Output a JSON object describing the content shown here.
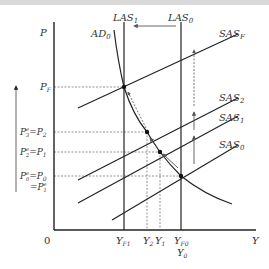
{
  "diagram": {
    "axes": {
      "y_label": "P",
      "x_label": "Y",
      "origin_label": "0"
    },
    "vertical_lines": [
      {
        "name": "LAS",
        "sub": "1",
        "x_label": "Y",
        "x_sub": "F1"
      },
      {
        "name": "LAS",
        "sub": "0",
        "x_label": "Y",
        "x_sub": "F0",
        "x_label2": "Y",
        "x_sub2": "0"
      }
    ],
    "demand_curve": {
      "name": "AD",
      "sub": "0"
    },
    "supply_curves": [
      {
        "name": "SAS",
        "sub": "F"
      },
      {
        "name": "SAS",
        "sub": "2"
      },
      {
        "name": "SAS",
        "sub": "1"
      },
      {
        "name": "SAS",
        "sub": "0"
      }
    ],
    "price_levels": [
      {
        "text": "P",
        "sub": "F"
      },
      {
        "lhs": "P",
        "lhs_sup": "e",
        "lhs_sub": "3",
        "rhs": "P",
        "rhs_sub": "2"
      },
      {
        "lhs": "P",
        "lhs_sup": "e",
        "lhs_sub": "2",
        "rhs": "P",
        "rhs_sub": "1"
      },
      {
        "lhs": "P",
        "lhs_sup": "e",
        "lhs_sub": "0",
        "rhs": "P",
        "rhs_sub": "0",
        "extra": "P",
        "extra_sup": "e",
        "extra_sub": "1"
      }
    ],
    "output_levels": [
      {
        "text": "Y",
        "sub": "2"
      },
      {
        "text": "Y",
        "sub": "1"
      }
    ],
    "equals": "="
  }
}
